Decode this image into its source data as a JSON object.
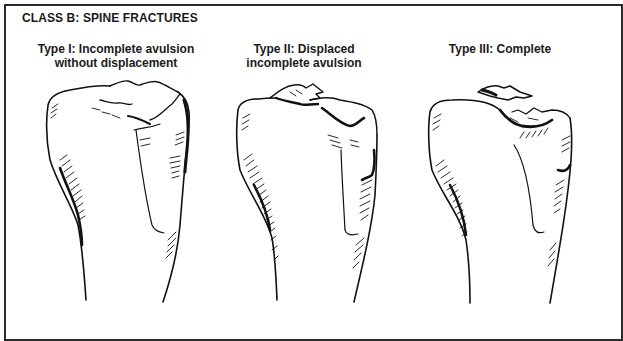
{
  "figure": {
    "class_title": "CLASS B: SPINE FRACTURES",
    "panels": [
      {
        "id": "type-1",
        "caption": "Type I: Incomplete avulsion\nwithout displacement"
      },
      {
        "id": "type-2",
        "caption": "Type II: Displaced\nincomplete avulsion"
      },
      {
        "id": "type-3",
        "caption": "Type III: Complete"
      }
    ],
    "colors": {
      "ink": "#111111",
      "border": "#2a2a2a",
      "background": "#ffffff"
    }
  }
}
